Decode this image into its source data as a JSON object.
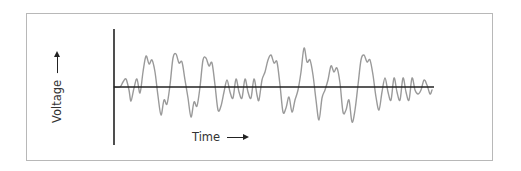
{
  "figure": {
    "x_axis_label": "Time",
    "y_axis_label": "Voltage",
    "x_arrow_icon": "right-arrow-icon",
    "y_arrow_icon": "up-arrow-icon"
  },
  "colors": {
    "frame_border": "#b8b8b8",
    "axis": "#222222",
    "waveform": "#9a9a9a",
    "label_text": "#333333"
  },
  "waveform": {
    "description": "Irregular voltage signal oscillating about the zero baseline over time",
    "baseline_y": 87,
    "points": [
      [
        114,
        87
      ],
      [
        120,
        87
      ],
      [
        123,
        82
      ],
      [
        126,
        79
      ],
      [
        129,
        90
      ],
      [
        131,
        101
      ],
      [
        134,
        88
      ],
      [
        137,
        79
      ],
      [
        140,
        93
      ],
      [
        143,
        72
      ],
      [
        146,
        56
      ],
      [
        149,
        64
      ],
      [
        152,
        60
      ],
      [
        155,
        72
      ],
      [
        158,
        96
      ],
      [
        161,
        115
      ],
      [
        164,
        100
      ],
      [
        167,
        104
      ],
      [
        170,
        85
      ],
      [
        173,
        58
      ],
      [
        176,
        54
      ],
      [
        179,
        63
      ],
      [
        182,
        62
      ],
      [
        185,
        80
      ],
      [
        188,
        98
      ],
      [
        191,
        117
      ],
      [
        194,
        102
      ],
      [
        197,
        106
      ],
      [
        200,
        87
      ],
      [
        203,
        60
      ],
      [
        206,
        58
      ],
      [
        209,
        66
      ],
      [
        212,
        63
      ],
      [
        215,
        85
      ],
      [
        218,
        110
      ],
      [
        221,
        106
      ],
      [
        224,
        92
      ],
      [
        227,
        80
      ],
      [
        230,
        92
      ],
      [
        233,
        98
      ],
      [
        236,
        79
      ],
      [
        239,
        92
      ],
      [
        242,
        98
      ],
      [
        245,
        79
      ],
      [
        248,
        92
      ],
      [
        251,
        98
      ],
      [
        254,
        79
      ],
      [
        257,
        95
      ],
      [
        259,
        100
      ],
      [
        262,
        80
      ],
      [
        265,
        72
      ],
      [
        268,
        60
      ],
      [
        271,
        55
      ],
      [
        274,
        63
      ],
      [
        277,
        62
      ],
      [
        280,
        85
      ],
      [
        283,
        112
      ],
      [
        286,
        108
      ],
      [
        289,
        97
      ],
      [
        292,
        112
      ],
      [
        295,
        100
      ],
      [
        298,
        90
      ],
      [
        301,
        72
      ],
      [
        304,
        48
      ],
      [
        307,
        62
      ],
      [
        310,
        60
      ],
      [
        313,
        75
      ],
      [
        316,
        100
      ],
      [
        319,
        120
      ],
      [
        322,
        98
      ],
      [
        325,
        90
      ],
      [
        328,
        80
      ],
      [
        331,
        66
      ],
      [
        334,
        72
      ],
      [
        337,
        68
      ],
      [
        340,
        83
      ],
      [
        343,
        112
      ],
      [
        346,
        110
      ],
      [
        349,
        100
      ],
      [
        352,
        122
      ],
      [
        355,
        110
      ],
      [
        358,
        85
      ],
      [
        361,
        60
      ],
      [
        364,
        55
      ],
      [
        367,
        62
      ],
      [
        370,
        60
      ],
      [
        373,
        75
      ],
      [
        376,
        97
      ],
      [
        379,
        110
      ],
      [
        382,
        92
      ],
      [
        385,
        78
      ],
      [
        388,
        92
      ],
      [
        391,
        100
      ],
      [
        394,
        78
      ],
      [
        397,
        92
      ],
      [
        400,
        100
      ],
      [
        403,
        78
      ],
      [
        406,
        92
      ],
      [
        409,
        100
      ],
      [
        412,
        78
      ],
      [
        415,
        90
      ],
      [
        418,
        94
      ],
      [
        421,
        90
      ],
      [
        424,
        80
      ],
      [
        427,
        85
      ],
      [
        430,
        94
      ],
      [
        432,
        90
      ]
    ]
  },
  "axes": {
    "origin": [
      114,
      87
    ],
    "y_axis": {
      "x": 114,
      "y_top": 29,
      "y_bottom": 145
    },
    "x_axis": {
      "y": 87,
      "x_start": 114,
      "x_end": 434
    }
  }
}
